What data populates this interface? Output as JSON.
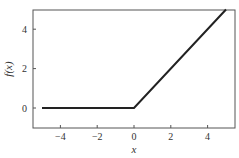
{
  "chart_data": {
    "type": "line",
    "title": "",
    "xlabel": "x",
    "ylabel": "f(x)",
    "xlim": [
      -5.5,
      5.5
    ],
    "ylim": [
      -1,
      5
    ],
    "grid": false,
    "legend": null,
    "x_ticks": [
      -4,
      -2,
      0,
      2,
      4
    ],
    "x_tick_labels": [
      "−4",
      "−2",
      "0",
      "2",
      "4"
    ],
    "y_ticks": [
      0,
      2,
      4
    ],
    "y_tick_labels": [
      "0",
      "2",
      "4"
    ],
    "series": [
      {
        "name": "f(x) = max(0, x)",
        "x": [
          -5,
          0,
          5
        ],
        "y": [
          0,
          0,
          5
        ],
        "color": "#222222"
      }
    ]
  }
}
